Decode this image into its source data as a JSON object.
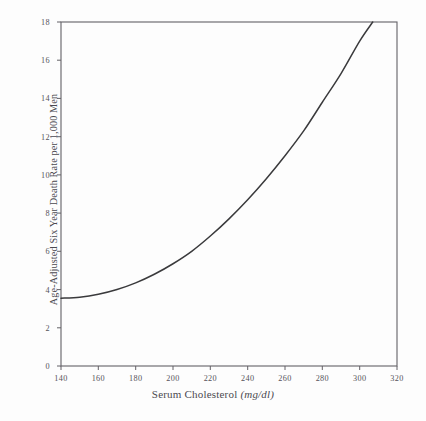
{
  "chart_data": {
    "type": "line",
    "title": "",
    "subtitle": "",
    "xlabel": "Serum Cholesterol",
    "xlabel_unit": "(mg/dl)",
    "ylabel": "Age-Adjusted Six Year Death Rate per 1,000 Men",
    "xlim": [
      140,
      320
    ],
    "ylim": [
      0,
      18
    ],
    "xticks": [
      140,
      160,
      180,
      200,
      220,
      240,
      260,
      280,
      300,
      320
    ],
    "yticks": [
      0,
      2,
      4,
      6,
      8,
      10,
      12,
      14,
      16,
      18
    ],
    "grid": false,
    "legend": null,
    "annotations": [],
    "series": [
      {
        "name": "Age-adjusted six year death rate",
        "x": [
          140,
          150,
          160,
          170,
          180,
          190,
          200,
          210,
          220,
          230,
          240,
          250,
          260,
          270,
          280,
          290,
          300,
          307
        ],
        "values": [
          3.55,
          3.6,
          3.75,
          4.0,
          4.35,
          4.8,
          5.35,
          6.0,
          6.8,
          7.7,
          8.7,
          9.8,
          11.0,
          12.3,
          13.8,
          15.3,
          17.0,
          18.0
        ]
      }
    ]
  },
  "axes": {
    "x_tick_labels": [
      "140",
      "160",
      "180",
      "200",
      "220",
      "240",
      "260",
      "280",
      "300",
      "320"
    ],
    "y_tick_labels": [
      "0",
      "2",
      "4",
      "6",
      "8",
      "10",
      "12",
      "14",
      "16",
      "18"
    ]
  },
  "style": {
    "curve_color": "#3a3a3c",
    "frame_color": "#636166",
    "text_color": "#4b4950",
    "background": "#fdfdfd"
  }
}
